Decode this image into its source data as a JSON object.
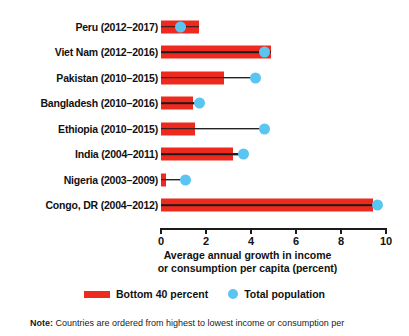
{
  "chart_data": {
    "type": "bar",
    "title": "",
    "subtitle": "",
    "xlabel": "Average annual growth in income or consumption per capita (percent)",
    "ylabel": "",
    "xlim": [
      0,
      10
    ],
    "ticks": [
      0,
      2,
      4,
      6,
      8,
      10
    ],
    "tick_labels": [
      "0",
      "2",
      "4",
      "6",
      "8",
      "10"
    ],
    "grid": false,
    "legend_position": "bottom",
    "orientation": "horizontal",
    "categories": [
      "Peru (2012–2017)",
      "Viet Nam (2012–2016)",
      "Pakistan (2010–2015)",
      "Bangladesh (2010–2016)",
      "Ethiopia (2010–2015)",
      "India (2004–2011)",
      "Nigeria (2003–2009)",
      "Congo, DR (2004–2012)"
    ],
    "series": [
      {
        "name": "Bottom 40 percent",
        "color": "#ee2a1e",
        "mark": "bar",
        "values": [
          1.7,
          4.9,
          2.8,
          1.4,
          1.5,
          3.2,
          0.2,
          9.4
        ]
      },
      {
        "name": "Total population",
        "color": "#5bc5f2",
        "mark": "dot",
        "values": [
          0.85,
          4.6,
          4.2,
          1.7,
          4.6,
          3.65,
          1.1,
          9.6
        ]
      }
    ],
    "axis_title_lines": [
      "Average annual growth in income",
      "or consumption per capita (percent)"
    ]
  },
  "legend": {
    "items": [
      {
        "label": "Bottom 40 percent",
        "color": "#ee2a1e",
        "shape": "bar"
      },
      {
        "label": "Total population",
        "color": "#5bc5f2",
        "shape": "dot"
      }
    ]
  },
  "note": {
    "prefix": "Note:",
    "text": "Countries are ordered from highest to lowest income or consumption per"
  }
}
